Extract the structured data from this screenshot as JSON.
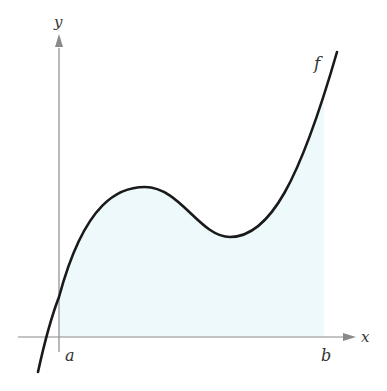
{
  "figure": {
    "type": "area-under-curve diagram",
    "function_label": "f",
    "axes": {
      "x_label": "x",
      "y_label": "y"
    },
    "interval": {
      "start_label": "a",
      "end_label": "b"
    },
    "colors": {
      "curve": "#1a1a1a",
      "axes": "#8a8a8a",
      "shading": "#eef9fc",
      "labels": "#333333"
    }
  }
}
